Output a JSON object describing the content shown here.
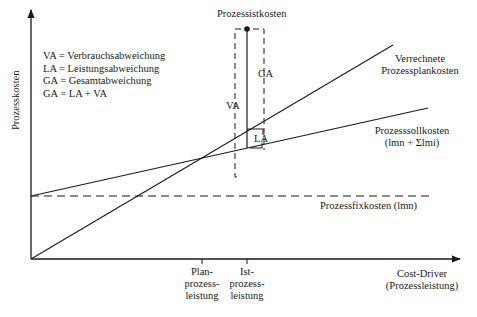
{
  "axes": {
    "y_label": "Prozesskosten",
    "x_label_line1": "Cost-Driver",
    "x_label_line2": "(Prozessleistung)"
  },
  "legend": {
    "items": [
      "VA = Verbrauchsabweichung",
      "LA = Leistungsabweichung",
      "GA = Gesamtabweichung",
      "GA = LA + VA"
    ]
  },
  "lines": {
    "verrechnete_line1": "Verrechnete",
    "verrechnete_line2": "Prozessplankosten",
    "soll_line1": "Prozesssollkosten",
    "soll_line2": "(lmn + Σlmi)",
    "fix": "Prozessfixkosten (lmn)"
  },
  "markers": {
    "ist_kosten": "Prozessistkosten",
    "va": "VA",
    "ga": "GA",
    "la": "LA"
  },
  "ticks": {
    "plan": [
      "Plan-",
      "prozess-",
      "leistung"
    ],
    "ist": [
      "Ist-",
      "prozess-",
      "leistung"
    ]
  },
  "colors": {
    "ink": "#1a1a1a",
    "background": "#ffffff"
  }
}
